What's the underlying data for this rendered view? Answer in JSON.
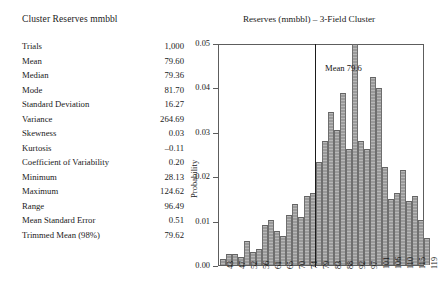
{
  "stats": {
    "title": "Cluster Reserves mmbbl",
    "rows": [
      {
        "label": "Trials",
        "value": "1,000"
      },
      {
        "label": "Mean",
        "value": "79.60"
      },
      {
        "label": "Median",
        "value": "79.36"
      },
      {
        "label": "Mode",
        "value": "81.70"
      },
      {
        "label": "Standard Deviation",
        "value": "16.27"
      },
      {
        "label": "Variance",
        "value": "264.69"
      },
      {
        "label": "Skewness",
        "value": "0.03"
      },
      {
        "label": "Kurtosis",
        "value": "–0.11"
      },
      {
        "label": "Coefficient of Variability",
        "value": "0.20"
      },
      {
        "label": "Minimum",
        "value": "28.13"
      },
      {
        "label": "Maximum",
        "value": "124.62"
      },
      {
        "label": "Range",
        "value": "96.49"
      },
      {
        "label": "Mean Standard Error",
        "value": "0.51"
      },
      {
        "label": "Trimmed Mean (98%)",
        "value": "79.62"
      }
    ]
  },
  "chart_data": {
    "type": "bar",
    "title": "Reserves (mmbbl) – 3-Field Cluster",
    "xlabel": "",
    "ylabel": "Probability",
    "ylim": [
      0,
      0.05
    ],
    "ytick_labels": [
      "0.00",
      "0.01",
      "0.02",
      "0.03",
      "0.04",
      "0.05"
    ],
    "ytick_values": [
      0,
      0.01,
      0.02,
      0.03,
      0.04,
      0.05
    ],
    "grid": false,
    "legend": "none",
    "annotations": [
      {
        "text": "Mean 79.6",
        "x": 79.6,
        "type": "vertical-line-label"
      }
    ],
    "xtick_labels": [
      "43",
      "47",
      "52",
      "56",
      "61",
      "65",
      "70",
      "74",
      "79",
      "83",
      "88",
      "92",
      "97",
      "101",
      "106",
      "110",
      "115",
      "119"
    ],
    "categories": [
      "43",
      "45",
      "47",
      "50",
      "52",
      "54",
      "56",
      "59",
      "61",
      "63",
      "65",
      "68",
      "70",
      "72",
      "74",
      "77",
      "79",
      "81",
      "83",
      "86",
      "88",
      "90",
      "92",
      "95",
      "97",
      "99",
      "101",
      "104",
      "106",
      "108",
      "110",
      "113",
      "115",
      "117",
      "119"
    ],
    "values": [
      0.0012,
      0.0024,
      0.0024,
      0.0018,
      0.0053,
      0.003,
      0.0036,
      0.0089,
      0.0101,
      0.0077,
      0.0065,
      0.0113,
      0.0137,
      0.0107,
      0.0155,
      0.0161,
      0.0232,
      0.028,
      0.0345,
      0.0304,
      0.0387,
      0.0262,
      0.0497,
      0.028,
      0.0262,
      0.0423,
      0.0399,
      0.022,
      0.0149,
      0.0161,
      0.0214,
      0.0143,
      0.0155,
      0.0101,
      0.006
    ],
    "bar_pixel_series": [
      {
        "left": 1,
        "w": 6,
        "h": 6
      },
      {
        "left": 7,
        "w": 6,
        "h": 11
      },
      {
        "left": 13,
        "w": 6,
        "h": 11
      },
      {
        "left": 19,
        "w": 6,
        "h": 8
      },
      {
        "left": 25,
        "w": 6,
        "h": 24
      },
      {
        "left": 31,
        "w": 6,
        "h": 13
      },
      {
        "left": 37,
        "w": 6,
        "h": 16
      },
      {
        "left": 43,
        "w": 6,
        "h": 40
      },
      {
        "left": 49,
        "w": 6,
        "h": 45
      },
      {
        "left": 55,
        "w": 6,
        "h": 34
      },
      {
        "left": 61,
        "w": 6,
        "h": 29
      },
      {
        "left": 67,
        "w": 6,
        "h": 50
      },
      {
        "left": 73,
        "w": 6,
        "h": 61
      },
      {
        "left": 79,
        "w": 6,
        "h": 48
      },
      {
        "left": 85,
        "w": 6,
        "h": 69
      },
      {
        "left": 91,
        "w": 6,
        "h": 72
      },
      {
        "left": 97,
        "w": 6,
        "h": 103
      },
      {
        "left": 103,
        "w": 6,
        "h": 124
      },
      {
        "left": 109,
        "w": 6,
        "h": 153
      },
      {
        "left": 115,
        "w": 6,
        "h": 135
      },
      {
        "left": 121,
        "w": 6,
        "h": 172
      },
      {
        "left": 127,
        "w": 6,
        "h": 116
      },
      {
        "left": 133,
        "w": 6,
        "h": 221
      },
      {
        "left": 139,
        "w": 6,
        "h": 124
      },
      {
        "left": 145,
        "w": 6,
        "h": 116
      },
      {
        "left": 151,
        "w": 6,
        "h": 188
      },
      {
        "left": 157,
        "w": 6,
        "h": 177
      },
      {
        "left": 163,
        "w": 6,
        "h": 98
      },
      {
        "left": 169,
        "w": 6,
        "h": 66
      },
      {
        "left": 175,
        "w": 6,
        "h": 72
      },
      {
        "left": 181,
        "w": 6,
        "h": 95
      },
      {
        "left": 187,
        "w": 6,
        "h": 64
      },
      {
        "left": 193,
        "w": 6,
        "h": 69
      },
      {
        "left": 199,
        "w": 6,
        "h": 45
      },
      {
        "left": 205,
        "w": 6,
        "h": 27
      }
    ],
    "mean_line_x_px": 96,
    "mean_label_left_px": 106,
    "mean_label_top_px": 18
  }
}
